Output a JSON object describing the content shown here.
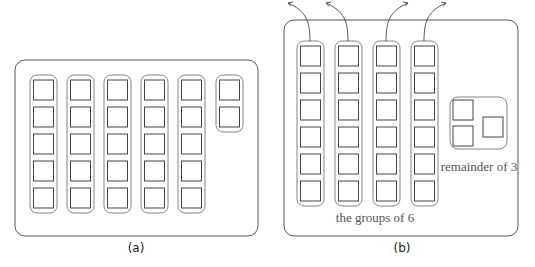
{
  "panels": [
    {
      "id": "a",
      "caption": "(a)",
      "frame": {
        "x": 15,
        "y": 60,
        "w": 243,
        "h": 176,
        "r": 10
      },
      "groups": [
        {
          "boxes": 5,
          "x": 30
        },
        {
          "boxes": 5,
          "x": 67
        },
        {
          "boxes": 5,
          "x": 104
        },
        {
          "boxes": 5,
          "x": 141
        },
        {
          "boxes": 5,
          "x": 178
        },
        {
          "boxes": 2,
          "x": 216
        }
      ]
    },
    {
      "id": "b",
      "caption": "(b)",
      "frame": {
        "x": 284,
        "y": 20,
        "w": 234,
        "h": 216,
        "r": 10
      },
      "groups": [
        {
          "boxes": 6,
          "x": 297
        },
        {
          "boxes": 6,
          "x": 335
        },
        {
          "boxes": 6,
          "x": 373
        },
        {
          "boxes": 6,
          "x": 411
        }
      ],
      "remainder_group": {
        "x": 450,
        "y": 97,
        "w": 57,
        "h": 52,
        "boxes": 3
      },
      "groups_label": "the groups of 6",
      "remainder_label": "remainder of 3",
      "arrows": 4
    }
  ]
}
